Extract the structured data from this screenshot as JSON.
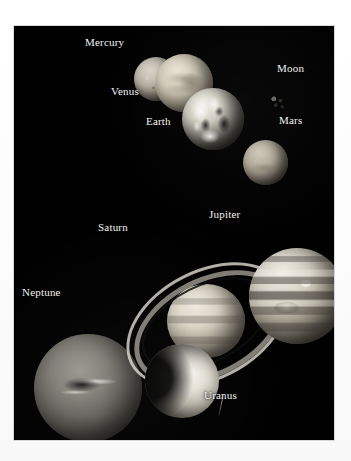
{
  "image": {
    "kind": "astronomy-photo-plate",
    "subject": "Solar System planets to scale",
    "background_color": "#ffffff",
    "plate_color": "#000000",
    "label_color": "#f2f2f0"
  },
  "labels": {
    "mercury": "Mercury",
    "venus": "Venus",
    "earth": "Earth",
    "moon": "Moon",
    "mars": "Mars",
    "jupiter": "Jupiter",
    "saturn": "Saturn",
    "uranus": "Uranus",
    "neptune": "Neptune"
  },
  "bodies": [
    {
      "name": "Mercury",
      "label": "Mercury",
      "group": "inner",
      "relative_size": "small",
      "appearance": "grey cratered sphere"
    },
    {
      "name": "Venus",
      "label": "Venus",
      "group": "inner",
      "relative_size": "medium",
      "appearance": "pale featureless cloud sphere"
    },
    {
      "name": "Earth",
      "label": "Earth",
      "group": "inner",
      "relative_size": "medium",
      "appearance": "high contrast clouds and continents"
    },
    {
      "name": "Moon",
      "label": "Moon",
      "group": "inner",
      "relative_size": "tiny",
      "appearance": "small cratered grey disc"
    },
    {
      "name": "Mars",
      "label": "Mars",
      "group": "inner",
      "relative_size": "small",
      "appearance": "smooth pale disc"
    },
    {
      "name": "Jupiter",
      "label": "Jupiter",
      "group": "outer",
      "relative_size": "largest",
      "appearance": "banded sphere with great red spot"
    },
    {
      "name": "Saturn",
      "label": "Saturn",
      "group": "outer",
      "relative_size": "large",
      "appearance": "banded sphere with tilted ring system"
    },
    {
      "name": "Uranus",
      "label": "Uranus",
      "group": "outer",
      "relative_size": "medium",
      "appearance": "crescent lit featureless sphere"
    },
    {
      "name": "Neptune",
      "label": "Neptune",
      "group": "outer",
      "relative_size": "large",
      "appearance": "soft glowing sphere with dark spot and bright streaks"
    }
  ]
}
